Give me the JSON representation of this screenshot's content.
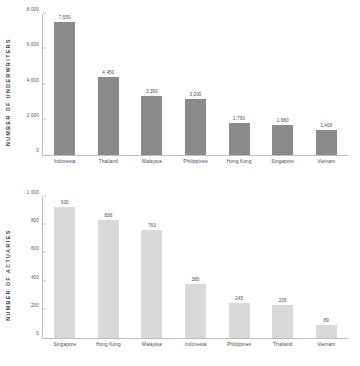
{
  "chart_data": [
    {
      "type": "bar",
      "id": "underwriters",
      "title": "",
      "xlabel": "",
      "ylabel": "NUMBER OF UNDERWRITERS",
      "categories": [
        "Indonesia",
        "Thailand",
        "Malaysia",
        "Philippines",
        "Hong Kong",
        "Singapore",
        "Vietnam"
      ],
      "values": [
        7550,
        4450,
        3350,
        3200,
        1790,
        1680,
        1403
      ],
      "value_labels": [
        "7,550",
        "4,450",
        "3,350",
        "3,200",
        "1,790",
        "1,680",
        "1,403"
      ],
      "yticks": [
        0,
        2000,
        4000,
        6000,
        8000
      ],
      "ytick_labels": [
        "0",
        "2,000",
        "4,000",
        "6,000",
        "8,000"
      ],
      "ylim": [
        0,
        8000
      ],
      "grid": false,
      "legend": false,
      "bar_color": "#8a8a8a",
      "axis_color": "#bdbdbd"
    },
    {
      "type": "bar",
      "id": "actuaries",
      "title": "",
      "xlabel": "",
      "ylabel": "NUMBER OF ACTUARIES",
      "categories": [
        "Singapore",
        "Hong Kong",
        "Malaysia",
        "Indonesia",
        "Philippines",
        "Thailand",
        "Vietnam"
      ],
      "values": [
        930,
        836,
        763,
        380,
        245,
        235,
        89
      ],
      "value_labels": [
        "930",
        "836",
        "763",
        "380",
        "245",
        "235",
        "89"
      ],
      "yticks": [
        0,
        200,
        400,
        600,
        800,
        1000
      ],
      "ytick_labels": [
        "0",
        "200",
        "400",
        "600",
        "800",
        "1,000"
      ],
      "ylim": [
        0,
        1000
      ],
      "grid": false,
      "legend": false,
      "bar_color": "#d9d9d9",
      "axis_color": "#bdbdbd"
    }
  ]
}
